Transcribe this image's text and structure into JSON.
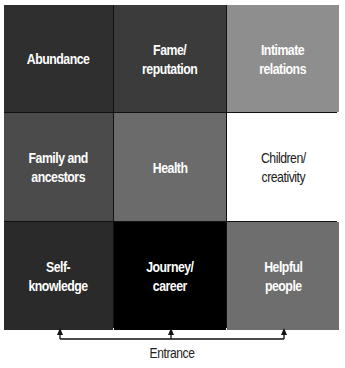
{
  "cells": [
    {
      "label": "Abundance",
      "color": "#2f2f2f",
      "text_color": "#ffffff"
    },
    {
      "label": "Fame/\nreputation",
      "color": "#3b3b3b",
      "text_color": "#ffffff"
    },
    {
      "label": "Intimate\nrelations",
      "color": "#8e8e8e",
      "text_color": "#ffffff"
    },
    {
      "label": "Family and\nancestors",
      "color": "#4b4b4b",
      "text_color": "#ffffff"
    },
    {
      "label": "Health",
      "color": "#6b6b6b",
      "text_color": "#ffffff"
    },
    {
      "label": "Children/\ncreativity",
      "color": "#ffffff",
      "text_color": "#1a1a1a"
    },
    {
      "label": "Self-\nknowledge",
      "color": "#2a2a2a",
      "text_color": "#ffffff"
    },
    {
      "label": "Journey/\ncareer",
      "color": "#000000",
      "text_color": "#ffffff"
    },
    {
      "label": "Helpful\npeople",
      "color": "#6e6e6e",
      "text_color": "#ffffff"
    }
  ],
  "entrance": {
    "label": "Entrance",
    "arrow_count": 3
  }
}
